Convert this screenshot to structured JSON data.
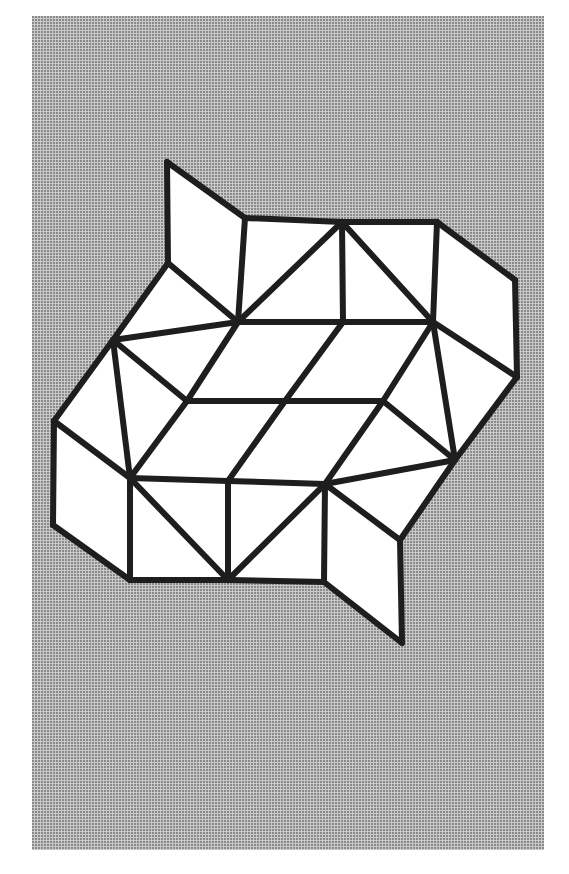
{
  "figure": {
    "title": "",
    "background_color": "#c9c9c9",
    "fill_color": "#ffffff",
    "stroke_color": "#1e1e1e",
    "vertices": {
      "A": [
        167,
        162
      ],
      "B": [
        245,
        218
      ],
      "C": [
        342,
        222
      ],
      "D": [
        437,
        222
      ],
      "E": [
        515,
        280
      ],
      "F": [
        517,
        377
      ],
      "G": [
        168,
        263
      ],
      "H": [
        238,
        322
      ],
      "I": [
        343,
        322
      ],
      "J": [
        433,
        322
      ],
      "K": [
        113,
        340
      ],
      "L": [
        54,
        421
      ],
      "M": [
        187,
        401
      ],
      "N": [
        285,
        401
      ],
      "O": [
        383,
        401
      ],
      "P": [
        455,
        460
      ],
      "Q": [
        130,
        478
      ],
      "R": [
        228,
        481
      ],
      "S": [
        325,
        484
      ],
      "T": [
        53,
        525
      ],
      "U": [
        400,
        540
      ],
      "V": [
        130,
        580
      ],
      "W": [
        228,
        580
      ],
      "X": [
        324,
        582
      ],
      "Y": [
        402,
        643
      ]
    },
    "edges": [
      [
        "A",
        "B"
      ],
      [
        "A",
        "G"
      ],
      [
        "G",
        "H"
      ],
      [
        "B",
        "H"
      ],
      [
        "B",
        "C"
      ],
      [
        "C",
        "D"
      ],
      [
        "C",
        "H"
      ],
      [
        "C",
        "I"
      ],
      [
        "C",
        "J"
      ],
      [
        "D",
        "E"
      ],
      [
        "E",
        "F"
      ],
      [
        "D",
        "J"
      ],
      [
        "J",
        "F"
      ],
      [
        "J",
        "I"
      ],
      [
        "I",
        "H"
      ],
      [
        "G",
        "K"
      ],
      [
        "K",
        "H"
      ],
      [
        "K",
        "L"
      ],
      [
        "L",
        "T"
      ],
      [
        "T",
        "V"
      ],
      [
        "K",
        "Q"
      ],
      [
        "K",
        "M"
      ],
      [
        "L",
        "Q"
      ],
      [
        "H",
        "M"
      ],
      [
        "I",
        "N"
      ],
      [
        "J",
        "O"
      ],
      [
        "J",
        "P"
      ],
      [
        "M",
        "N"
      ],
      [
        "N",
        "O"
      ],
      [
        "M",
        "Q"
      ],
      [
        "N",
        "R"
      ],
      [
        "O",
        "S"
      ],
      [
        "O",
        "P"
      ],
      [
        "Q",
        "R"
      ],
      [
        "R",
        "S"
      ],
      [
        "S",
        "P"
      ],
      [
        "F",
        "P"
      ],
      [
        "P",
        "U"
      ],
      [
        "Q",
        "V"
      ],
      [
        "Q",
        "W"
      ],
      [
        "R",
        "W"
      ],
      [
        "S",
        "W"
      ],
      [
        "S",
        "X"
      ],
      [
        "V",
        "W"
      ],
      [
        "W",
        "X"
      ],
      [
        "S",
        "U"
      ],
      [
        "U",
        "Y"
      ],
      [
        "Y",
        "X"
      ]
    ],
    "faces": [
      [
        "A",
        "B",
        "H",
        "G"
      ],
      [
        "B",
        "C",
        "H"
      ],
      [
        "C",
        "I",
        "H"
      ],
      [
        "C",
        "J",
        "I"
      ],
      [
        "C",
        "D",
        "J"
      ],
      [
        "D",
        "E",
        "F",
        "J"
      ],
      [
        "G",
        "H",
        "K"
      ],
      [
        "K",
        "H",
        "M"
      ],
      [
        "H",
        "I",
        "N",
        "M"
      ],
      [
        "I",
        "J",
        "O",
        "N"
      ],
      [
        "J",
        "P",
        "O"
      ],
      [
        "J",
        "F",
        "P"
      ],
      [
        "K",
        "L",
        "Q"
      ],
      [
        "K",
        "M",
        "Q"
      ],
      [
        "M",
        "N",
        "R",
        "Q"
      ],
      [
        "N",
        "O",
        "S",
        "R"
      ],
      [
        "O",
        "P",
        "S"
      ],
      [
        "L",
        "T",
        "V",
        "Q"
      ],
      [
        "Q",
        "W",
        "V"
      ],
      [
        "Q",
        "R",
        "W"
      ],
      [
        "R",
        "S",
        "W"
      ],
      [
        "S",
        "X",
        "W"
      ],
      [
        "S",
        "P",
        "U"
      ],
      [
        "S",
        "U",
        "Y",
        "X"
      ]
    ]
  }
}
